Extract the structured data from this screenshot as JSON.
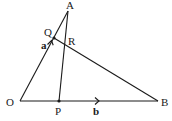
{
  "diagram": {
    "type": "geometry-vector-triangle",
    "points": {
      "O": {
        "label": "O",
        "x": 20,
        "y": 101
      },
      "A": {
        "label": "A",
        "x": 68,
        "y": 11
      },
      "B": {
        "label": "B",
        "x": 158,
        "y": 101
      },
      "P": {
        "label": "P",
        "x": 59,
        "y": 101
      },
      "Q": {
        "label": "Q",
        "x": 54,
        "y": 38
      },
      "R": {
        "label": "R",
        "x": 64,
        "y": 44
      }
    },
    "segments": [
      {
        "from": "O",
        "to": "A"
      },
      {
        "from": "O",
        "to": "B"
      },
      {
        "from": "A",
        "to": "P"
      },
      {
        "from": "Q",
        "to": "B"
      }
    ],
    "vectors": {
      "a": {
        "label": "a",
        "on": "OA"
      },
      "b": {
        "label": "b",
        "on": "OB"
      }
    },
    "colors": {
      "ink": "#1a1a1a",
      "background": "#ffffff"
    }
  }
}
